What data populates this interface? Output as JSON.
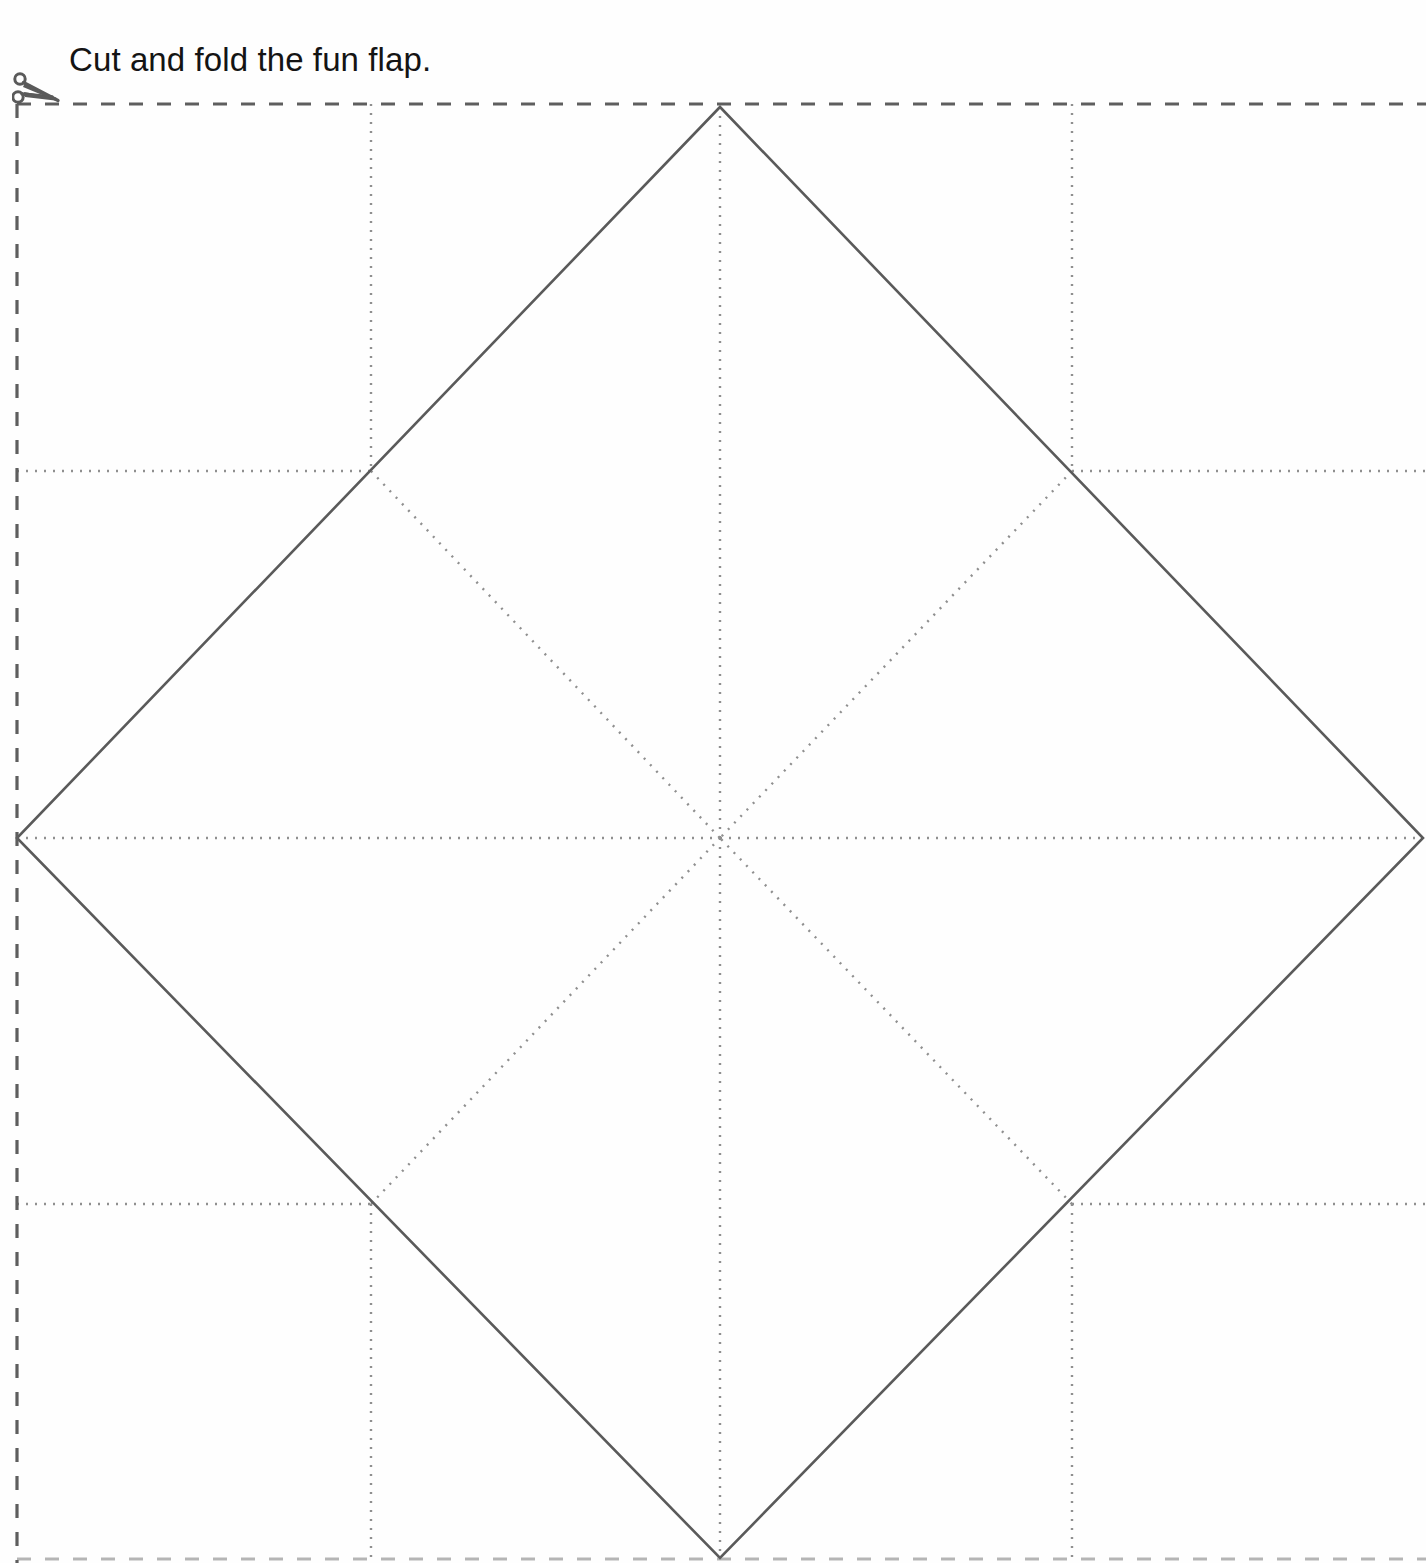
{
  "page": {
    "width": 1426,
    "height": 1563,
    "background_color": "#fefefe"
  },
  "instruction": {
    "text": "Cut and fold the fun flap.",
    "color": "#141414",
    "font_size_px": 33
  },
  "icons": {
    "scissors": {
      "name": "scissors-icon",
      "color": "#5a5a5a",
      "position": {
        "x": 12,
        "y": 70
      }
    }
  },
  "colors": {
    "cut_line": "#5e5e5e",
    "fold_line": "#8f8f8f",
    "shape_outline": "#5a5a5a",
    "text": "#141414"
  },
  "diagram": {
    "type": "cut-and-fold-template",
    "cut_border": {
      "style": "dashed",
      "color": "#5e5e5e",
      "stroke_width": 3,
      "dash_pattern": "14 14",
      "segments": [
        {
          "name": "top-cut-line",
          "x1": 17,
          "y1": 104,
          "x2": 1426,
          "y2": 104
        },
        {
          "name": "left-cut-line",
          "x1": 17,
          "y1": 104,
          "x2": 17,
          "y2": 1563
        },
        {
          "name": "bottom-cut-line",
          "x1": 17,
          "y1": 1559,
          "x2": 1426,
          "y2": 1559
        }
      ]
    },
    "diamond": {
      "name": "fun-flap-diamond",
      "style": "solid",
      "color": "#5a5a5a",
      "stroke_width": 2.6,
      "vertices": [
        {
          "label": "top",
          "x": 720,
          "y": 107
        },
        {
          "label": "right",
          "x": 1423,
          "y": 838
        },
        {
          "label": "bottom",
          "x": 720,
          "y": 1558
        },
        {
          "label": "left",
          "x": 17,
          "y": 838
        }
      ]
    },
    "center": {
      "x": 720,
      "y": 838
    },
    "grid_intersections": [
      {
        "label": "top-left",
        "x": 371,
        "y": 471
      },
      {
        "label": "top-right",
        "x": 1072,
        "y": 471
      },
      {
        "label": "bottom-left",
        "x": 371,
        "y": 1204
      },
      {
        "label": "bottom-right",
        "x": 1072,
        "y": 1204
      }
    ],
    "fold_lines": {
      "style": "dotted",
      "color": "#8f8f8f",
      "stroke_width": 2.4,
      "dash_pattern": "2 7",
      "segments": [
        {
          "name": "fold-vertical-center-top",
          "x1": 720,
          "y1": 107,
          "x2": 720,
          "y2": 838
        },
        {
          "name": "fold-vertical-center-bottom",
          "x1": 720,
          "y1": 838,
          "x2": 720,
          "y2": 1558
        },
        {
          "name": "fold-horizontal-center-left",
          "x1": 17,
          "y1": 838,
          "x2": 720,
          "y2": 838
        },
        {
          "name": "fold-horizontal-center-right",
          "x1": 720,
          "y1": 838,
          "x2": 1423,
          "y2": 838
        },
        {
          "name": "fold-diagonal-top-left",
          "x1": 371,
          "y1": 471,
          "x2": 720,
          "y2": 838
        },
        {
          "name": "fold-diagonal-top-right",
          "x1": 1072,
          "y1": 471,
          "x2": 720,
          "y2": 838
        },
        {
          "name": "fold-diagonal-bottom-left",
          "x1": 371,
          "y1": 1204,
          "x2": 720,
          "y2": 838
        },
        {
          "name": "fold-diagonal-bottom-right",
          "x1": 1072,
          "y1": 1204,
          "x2": 720,
          "y2": 838
        },
        {
          "name": "guide-vertical-left-upper",
          "x1": 371,
          "y1": 104,
          "x2": 371,
          "y2": 471
        },
        {
          "name": "guide-vertical-left-lower",
          "x1": 371,
          "y1": 1204,
          "x2": 371,
          "y2": 1563
        },
        {
          "name": "guide-vertical-right-upper",
          "x1": 1072,
          "y1": 104,
          "x2": 1072,
          "y2": 471
        },
        {
          "name": "guide-vertical-right-lower",
          "x1": 1072,
          "y1": 1204,
          "x2": 1072,
          "y2": 1563
        },
        {
          "name": "guide-horizontal-upper-left",
          "x1": 17,
          "y1": 471,
          "x2": 371,
          "y2": 471
        },
        {
          "name": "guide-horizontal-upper-right",
          "x1": 1072,
          "y1": 471,
          "x2": 1426,
          "y2": 471
        },
        {
          "name": "guide-horizontal-lower-left",
          "x1": 17,
          "y1": 1204,
          "x2": 371,
          "y2": 1204
        },
        {
          "name": "guide-horizontal-lower-right",
          "x1": 1072,
          "y1": 1204,
          "x2": 1426,
          "y2": 1204
        }
      ]
    }
  }
}
